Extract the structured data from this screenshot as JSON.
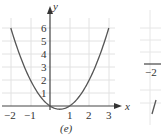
{
  "chart_data": [
    {
      "type": "line",
      "caption": "(e)",
      "title": "",
      "xlabel": "x",
      "ylabel": "y",
      "xlim": [
        -2.5,
        3.5
      ],
      "ylim": [
        -0.5,
        6.5
      ],
      "grid": true,
      "x_ticks": [
        "−2",
        "−1",
        "1",
        "2",
        "3"
      ],
      "y_ticks": [
        "1",
        "2",
        "3",
        "4",
        "5",
        "6"
      ],
      "series": [
        {
          "name": "y = x² − x",
          "x": [
            -2,
            -1.5,
            -1,
            -0.5,
            0,
            0.5,
            1,
            1.5,
            2,
            2.5,
            3
          ],
          "y": [
            6,
            3.75,
            2,
            0.75,
            0,
            -0.25,
            0,
            0.75,
            2,
            3.75,
            6
          ]
        }
      ],
      "colors": {
        "curve": "#555555",
        "axis": "#444444",
        "grid": "#e2e2e2"
      }
    },
    {
      "type": "line",
      "caption": "",
      "note": "partially visible adjacent panel (cropped at right edge)",
      "x_ticks": [
        "−2"
      ]
    }
  ]
}
